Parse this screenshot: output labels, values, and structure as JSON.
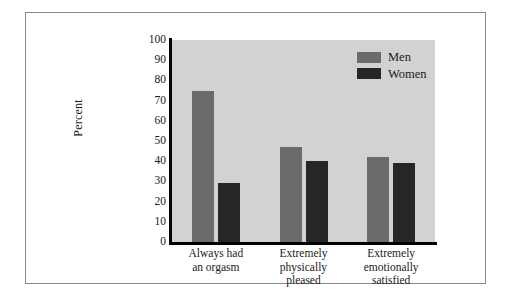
{
  "chart_data": {
    "type": "bar",
    "title": "",
    "subtitle": "",
    "xlabel": "",
    "ylabel": "Percent",
    "ylim": [
      0,
      100
    ],
    "yticks": [
      0,
      10,
      20,
      30,
      40,
      50,
      60,
      70,
      80,
      90,
      100
    ],
    "ytick_labels": [
      "0",
      "10",
      "20",
      "30",
      "40",
      "50",
      "60",
      "70",
      "80",
      "90",
      "100"
    ],
    "grid": false,
    "legend_position": "top-right",
    "categories": [
      "Always had an orgasm",
      "Extremely physically pleased",
      "Extremely emotionally satisfied"
    ],
    "category_lines": [
      [
        "Always had",
        "an orgasm"
      ],
      [
        "Extremely",
        "physically",
        "pleased"
      ],
      [
        "Extremely",
        "emotionally",
        "satisfied"
      ]
    ],
    "series": [
      {
        "name": "Men",
        "color": "#6b6b6b",
        "values": [
          75,
          47,
          42
        ]
      },
      {
        "name": "Women",
        "color": "#262626",
        "values": [
          29,
          40,
          39
        ]
      }
    ]
  },
  "figure": {
    "plot_background": "#d2d2d2",
    "axis_color": "#000000",
    "frame_color": "#8a8a8a",
    "page_background": "#ffffff"
  }
}
